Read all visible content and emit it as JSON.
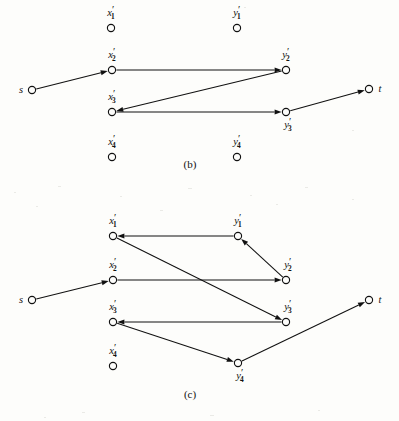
{
  "figure": {
    "background_color": "#fdfdfb",
    "ink_color": "#111111",
    "panels": [
      {
        "id": "b",
        "caption": "(b)",
        "caption_x": 190,
        "caption_y": 168,
        "nodes": [
          {
            "id": "b-x1",
            "base": "x",
            "sub": "1",
            "prime": true,
            "label": "x′1",
            "cx": 111,
            "cy": 28,
            "r": 3.6,
            "label_x": 111,
            "label_y": 16,
            "label_anchor": "middle"
          },
          {
            "id": "b-y1",
            "base": "y",
            "sub": "1",
            "prime": true,
            "label": "y′1",
            "cx": 237,
            "cy": 28,
            "r": 3.6,
            "label_x": 237,
            "label_y": 16,
            "label_anchor": "middle"
          },
          {
            "id": "b-x2",
            "base": "x",
            "sub": "2",
            "prime": true,
            "label": "x′2",
            "cx": 112,
            "cy": 70,
            "r": 3.6,
            "label_x": 112,
            "label_y": 58,
            "label_anchor": "middle"
          },
          {
            "id": "b-y2",
            "base": "y",
            "sub": "2",
            "prime": true,
            "label": "y′2",
            "cx": 286,
            "cy": 70,
            "r": 3.6,
            "label_x": 286,
            "label_y": 58,
            "label_anchor": "middle"
          },
          {
            "id": "b-x3",
            "base": "x",
            "sub": "3",
            "prime": true,
            "label": "x′3",
            "cx": 112,
            "cy": 112,
            "r": 3.6,
            "label_x": 112,
            "label_y": 100,
            "label_anchor": "middle"
          },
          {
            "id": "b-y3",
            "base": "y",
            "sub": "3",
            "prime": true,
            "label": "y′3",
            "cx": 286,
            "cy": 112,
            "r": 3.6,
            "label_x": 288,
            "label_y": 128,
            "label_anchor": "middle"
          },
          {
            "id": "b-x4",
            "base": "x",
            "sub": "4",
            "prime": true,
            "label": "x′4",
            "cx": 112,
            "cy": 157,
            "r": 3.6,
            "label_x": 112,
            "label_y": 145,
            "label_anchor": "middle"
          },
          {
            "id": "b-y4",
            "base": "y",
            "sub": "4",
            "prime": true,
            "label": "y′4",
            "cx": 237,
            "cy": 157,
            "r": 3.6,
            "label_x": 237,
            "label_y": 145,
            "label_anchor": "middle"
          },
          {
            "id": "b-s",
            "base": "s",
            "sub": "",
            "prime": false,
            "label": "s",
            "cx": 32,
            "cy": 90,
            "r": 3.6,
            "label_x": 21,
            "label_y": 93,
            "label_anchor": "middle"
          },
          {
            "id": "b-t",
            "base": "t",
            "sub": "",
            "prime": false,
            "label": "t",
            "cx": 369,
            "cy": 89,
            "r": 3.6,
            "label_x": 380,
            "label_y": 92,
            "label_anchor": "middle"
          }
        ],
        "edges": [
          {
            "id": "b-e1",
            "from": "b-s",
            "to": "b-x2",
            "label": "s to x'2"
          },
          {
            "id": "b-e2",
            "from": "b-x2",
            "to": "b-y2",
            "label": "x'2 to y'2"
          },
          {
            "id": "b-e3",
            "from": "b-y2",
            "to": "b-x3",
            "label": "y'2 to x'3"
          },
          {
            "id": "b-e4",
            "from": "b-x3",
            "to": "b-y3",
            "label": "x'3 to y'3"
          },
          {
            "id": "b-e5",
            "from": "b-y3",
            "to": "b-t",
            "label": "y'3 to t"
          }
        ]
      },
      {
        "id": "c",
        "caption": "(c)",
        "caption_x": 190,
        "caption_y": 398,
        "nodes": [
          {
            "id": "c-x1",
            "base": "x",
            "sub": "1",
            "prime": true,
            "label": "x′1",
            "cx": 113,
            "cy": 236,
            "r": 3.6,
            "label_x": 113,
            "label_y": 224,
            "label_anchor": "middle"
          },
          {
            "id": "c-y1",
            "base": "y",
            "sub": "1",
            "prime": true,
            "label": "y′1",
            "cx": 238,
            "cy": 236,
            "r": 3.6,
            "label_x": 238,
            "label_y": 224,
            "label_anchor": "middle"
          },
          {
            "id": "c-x2",
            "base": "x",
            "sub": "2",
            "prime": true,
            "label": "x′2",
            "cx": 113,
            "cy": 280,
            "r": 3.6,
            "label_x": 113,
            "label_y": 268,
            "label_anchor": "middle"
          },
          {
            "id": "c-y2",
            "base": "y",
            "sub": "2",
            "prime": true,
            "label": "y′2",
            "cx": 286,
            "cy": 280,
            "r": 3.6,
            "label_x": 288,
            "label_y": 268,
            "label_anchor": "middle"
          },
          {
            "id": "c-x3",
            "base": "x",
            "sub": "3",
            "prime": true,
            "label": "x′3",
            "cx": 113,
            "cy": 322,
            "r": 3.6,
            "label_x": 113,
            "label_y": 310,
            "label_anchor": "middle"
          },
          {
            "id": "c-y3",
            "base": "y",
            "sub": "3",
            "prime": true,
            "label": "y′3",
            "cx": 286,
            "cy": 322,
            "r": 3.6,
            "label_x": 288,
            "label_y": 310,
            "label_anchor": "middle"
          },
          {
            "id": "c-x4",
            "base": "x",
            "sub": "4",
            "prime": true,
            "label": "x′4",
            "cx": 113,
            "cy": 366,
            "r": 3.6,
            "label_x": 113,
            "label_y": 354,
            "label_anchor": "middle"
          },
          {
            "id": "c-y4",
            "base": "y",
            "sub": "4",
            "prime": true,
            "label": "y′4",
            "cx": 238,
            "cy": 363,
            "r": 3.6,
            "label_x": 240,
            "label_y": 379,
            "label_anchor": "middle"
          },
          {
            "id": "c-s",
            "base": "s",
            "sub": "",
            "prime": false,
            "label": "s",
            "cx": 32,
            "cy": 300,
            "r": 3.6,
            "label_x": 21,
            "label_y": 303,
            "label_anchor": "middle"
          },
          {
            "id": "c-t",
            "base": "t",
            "sub": "",
            "prime": false,
            "label": "t",
            "cx": 369,
            "cy": 300,
            "r": 3.6,
            "label_x": 380,
            "label_y": 303,
            "label_anchor": "middle"
          }
        ],
        "edges": [
          {
            "id": "c-e1",
            "from": "c-y1",
            "to": "c-x1",
            "label": "y'1 to x'1"
          },
          {
            "id": "c-e2",
            "from": "c-y2",
            "to": "c-y1",
            "label": "y'2 to y'1"
          },
          {
            "id": "c-e3",
            "from": "c-x1",
            "to": "c-y3",
            "label": "x'1 to y'3"
          },
          {
            "id": "c-e4",
            "from": "c-s",
            "to": "c-x2",
            "label": "s to x'2"
          },
          {
            "id": "c-e5",
            "from": "c-x2",
            "to": "c-y2",
            "label": "x'2 to y'2"
          },
          {
            "id": "c-e6",
            "from": "c-y3",
            "to": "c-x3",
            "label": "y'3 to x'3"
          },
          {
            "id": "c-e7",
            "from": "c-x3",
            "to": "c-y4",
            "label": "x'3 to y'4"
          },
          {
            "id": "c-e8",
            "from": "c-y4",
            "to": "c-t",
            "label": "y'4 to t"
          }
        ]
      }
    ]
  }
}
